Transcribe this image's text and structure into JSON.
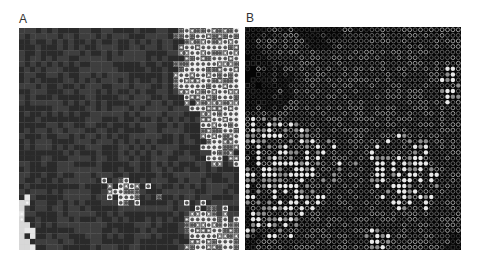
{
  "figure": {
    "panels": [
      {
        "id": "A",
        "label": "A",
        "grid": {
          "cols": 40,
          "rows": 40
        },
        "background": "#d4d4d4",
        "seed": 1337,
        "palette": {
          "light": "#d8d8d8",
          "lighter": "#e6e6e6",
          "dark": "#3e3e3e",
          "darker": "#2a2a2a",
          "ring_fill": "#f0f0f0",
          "ring_stroke": "#3a3a3a",
          "dot": "#555555"
        },
        "cell_types": [
          "light",
          "dark",
          "ring",
          "dot"
        ],
        "weights": {
          "dark": 0.34,
          "ring": 0.2,
          "dot": 0.1,
          "light": 0.36
        }
      },
      {
        "id": "B",
        "label": "B",
        "grid": {
          "cols": 40,
          "rows": 40
        },
        "background": "#050505",
        "seed": 4242,
        "palette": {
          "bg": "#050505",
          "ring_dim": "#3a3a3a",
          "ring_mid": "#6a6a6a",
          "ring_bright": "#a8a8a8",
          "fill_bright": "#e8e8e8",
          "fill_mid": "#8c8c8c"
        },
        "cell_types": [
          "empty",
          "ring-dim",
          "ring-mid",
          "ring-bright",
          "fill-mid",
          "fill-bright"
        ],
        "weights": {
          "empty": 0.42,
          "ring-dim": 0.28,
          "ring-mid": 0.14,
          "ring-bright": 0.06,
          "fill-mid": 0.06,
          "fill-bright": 0.04
        }
      }
    ]
  }
}
